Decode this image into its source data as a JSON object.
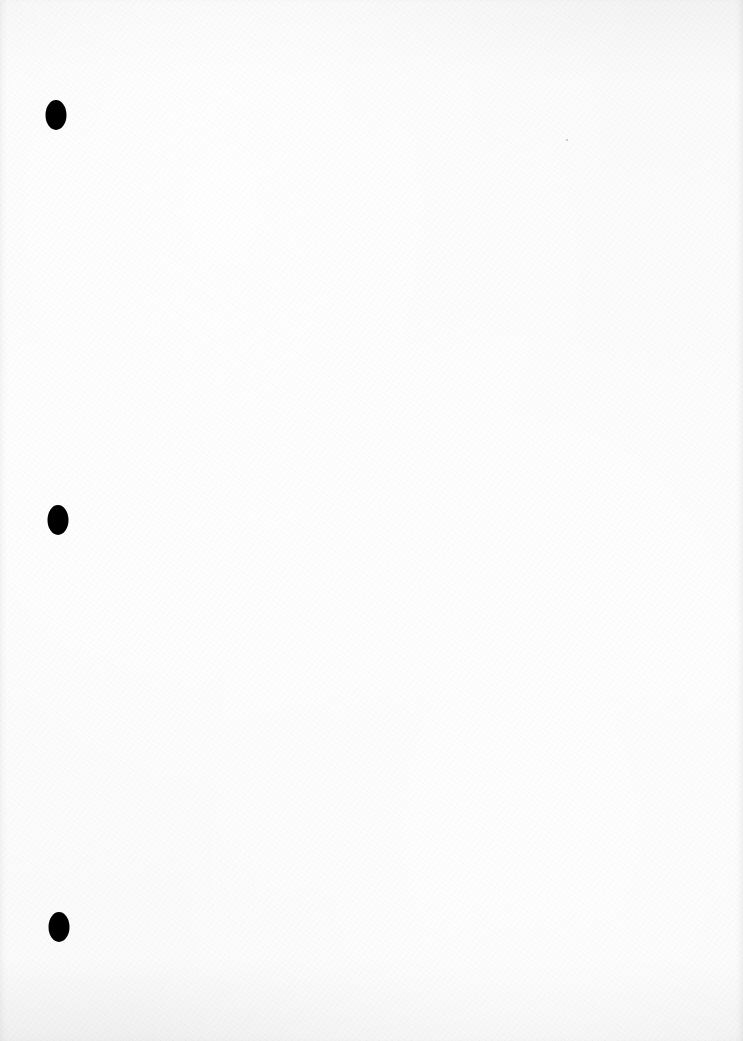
{
  "document": {
    "type": "blank-hole-punched-sheet",
    "background_color": "#fbfbfb",
    "text_content": "",
    "punch_holes": [
      {
        "x": 56,
        "y": 115,
        "color": "#000000"
      },
      {
        "x": 58,
        "y": 520,
        "color": "#000000"
      },
      {
        "x": 59,
        "y": 927,
        "color": "#000000"
      }
    ]
  }
}
